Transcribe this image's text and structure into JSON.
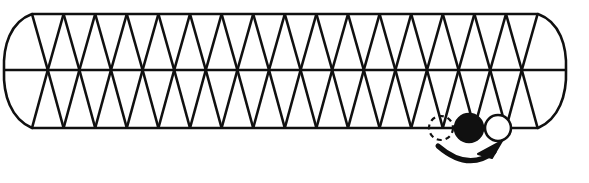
{
  "figure": {
    "canvas": {
      "width": 589,
      "height": 183
    },
    "colors": {
      "background": "#ffffff",
      "stroke": "#101010",
      "filled_site": "#101010",
      "empty_site_fill": "#ffffff",
      "arrow": "#101010"
    },
    "stroke_widths": {
      "lattice_line": 2.6,
      "cap_arc": 2.6,
      "site_outline": 2.6,
      "dashed_outline": 2.2,
      "arrow": 5.0
    }
  },
  "lattice": {
    "rows": [
      {
        "name": "top-line",
        "y": 14,
        "x_start": 32,
        "x_end": 538
      },
      {
        "name": "middle-line",
        "y": 70,
        "x_start": 5,
        "x_end": 565
      },
      {
        "name": "bottom-line",
        "y": 128,
        "x_start": 32,
        "x_end": 538
      }
    ],
    "column_spacing": 31.6,
    "apex_columns": 17,
    "apex_x_start": 32,
    "mid_x_start": 47.8,
    "mid_columns": 17
  },
  "caps": {
    "left": {
      "name": "left-cap-arc",
      "top_x": 32,
      "top_y": 14,
      "bulge_x": 5,
      "mid_y": 70,
      "bottom_x": 32,
      "bottom_y": 128
    },
    "right": {
      "name": "right-cap-arc",
      "top_x": 538,
      "top_y": 14,
      "bulge_x": 565,
      "mid_y": 70,
      "bottom_x": 538,
      "bottom_y": 128
    }
  },
  "sites": [
    {
      "name": "vacated-site",
      "style": "dashed-outline",
      "cx": 441,
      "cy": 128,
      "r": 12,
      "label": "vacated site"
    },
    {
      "name": "filled-site",
      "style": "solid-filled",
      "cx": 469,
      "cy": 128,
      "r": 14,
      "label": "occupied site"
    },
    {
      "name": "empty-site",
      "style": "open-outline",
      "cx": 498,
      "cy": 128,
      "r": 13,
      "label": "empty site"
    }
  ],
  "arrow": {
    "name": "move-arrow",
    "path": "M 438 146 Q 468 172 494 152",
    "head": {
      "tip_x": 502,
      "tip_y": 141,
      "points": "502,141 478,154 492,158"
    },
    "meaning": "particle hop from vacated site toward the empty site"
  }
}
